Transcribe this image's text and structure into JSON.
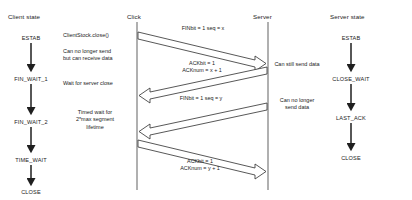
{
  "diagram": {
    "type": "sequence-diagram",
    "background": "#ffffff",
    "line_color": "#6f6f6f",
    "arrow_color": "#3a3a3a",
    "text_color": "#1a1a1a"
  },
  "columns": {
    "client_state": "Client state",
    "client_lifeline": "Click",
    "server_lifeline": "Server",
    "server_state": "Server state"
  },
  "client_states": [
    {
      "name": "ESTAB"
    },
    {
      "name": "FIN_WAIT_1"
    },
    {
      "name": "FIN_WAIT_2"
    },
    {
      "name": "TIME_WAIT"
    },
    {
      "name": "CLOSE"
    }
  ],
  "server_states": [
    {
      "name": "ESTAB"
    },
    {
      "name": "CLOSE_WAIT"
    },
    {
      "name": "LAST_ACK"
    },
    {
      "name": "CLOSE"
    }
  ],
  "client_notes": [
    {
      "text": "ClientStock.close()"
    },
    {
      "line1": "Can no longer send",
      "line2": "but can receive data"
    },
    {
      "text": "Wait for server close"
    },
    {
      "line1": "Timed wait for",
      "line2": "2*max segment",
      "line3": "lifetime"
    }
  ],
  "server_notes": [
    {
      "text": "Can still send data"
    },
    {
      "line1": "Can no longer",
      "line2": "send data"
    }
  ],
  "messages": [
    {
      "id": "fin-x",
      "direction": "client-to-server",
      "line1": "FINbit = 1  seq = x",
      "line2": ""
    },
    {
      "id": "ack-x1",
      "direction": "server-to-client",
      "line1": "ACKbit = 1",
      "line2": "ACKnum = x + 1"
    },
    {
      "id": "fin-y",
      "direction": "server-to-client",
      "line1": "FINbit = 1  seq = y",
      "line2": ""
    },
    {
      "id": "ack-y1",
      "direction": "client-to-server",
      "line1": "ACKbit = 1",
      "line2": "ACKnum = y + 1"
    }
  ]
}
